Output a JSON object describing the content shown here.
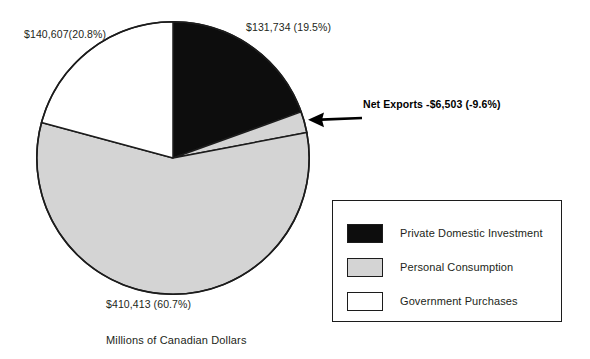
{
  "caption": "Millions of Canadian Dollars",
  "labels": {
    "investment": "$131,734 (19.5%)",
    "government": "$140,607(20.8%)",
    "consumption": "$410,413 (60.7%)",
    "net_exports_callout": "Net Exports -$6,503 (-9.6%)"
  },
  "legend": {
    "items": [
      {
        "label": "Private Domestic Investment",
        "color": "#0d0d0d"
      },
      {
        "label": "Personal Consumption",
        "color": "#d4d4d4"
      },
      {
        "label": "Government Purchases",
        "color": "#ffffff"
      }
    ]
  },
  "chart_data": {
    "type": "pie",
    "title": "",
    "subtitle": "",
    "xlabel": "",
    "ylabel": "Millions of Canadian Dollars",
    "units": "Millions of Canadian Dollars",
    "currency": "CAD",
    "grid": false,
    "legend_position": "bottom-right",
    "start_angle_deg": 0,
    "direction": "clockwise",
    "categories": [
      "Private Domestic Investment",
      "Net Exports",
      "Personal Consumption",
      "Government Purchases"
    ],
    "values": [
      131734,
      -6503,
      410413,
      140607
    ],
    "percentages": [
      19.5,
      -9.6,
      60.7,
      20.8
    ],
    "colors": [
      "#0d0d0d",
      "#d4d4d4",
      "#d4d4d4",
      "#ffffff"
    ],
    "value_labels": [
      "$131,734 (19.5%)",
      "Net Exports -$6,503 (-9.6%)",
      "$410,413 (60.7%)",
      "$140,607(20.8%)"
    ],
    "drawn_sweep_deg": [
      70.2,
      9.0,
      205.9,
      74.9
    ],
    "annotations": [
      {
        "text": "Net Exports -$6,503 (-9.6%)",
        "target": "Net Exports",
        "style": "arrow-pointing-left",
        "bold": true
      }
    ]
  },
  "geometry": {
    "pie_center_x": 173,
    "pie_center_y": 158,
    "pie_radius": 137
  }
}
